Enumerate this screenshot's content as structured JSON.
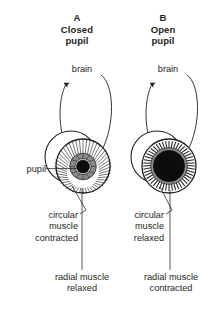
{
  "figure": {
    "type": "biological-diagram",
    "background_color": "#ffffff",
    "ink_color": "#231f20"
  },
  "panels": [
    {
      "id": "a",
      "letter": "A",
      "title": "A\nClosed\npupil",
      "state": "closed pupil",
      "brain_label": "brain",
      "pupil_label": "pupil",
      "circular_muscle_label": "circular\nmuscle\ncontracted",
      "radial_muscle_label": "radial muscle\nrelaxed",
      "pupil_diameter_px": 13,
      "iris_outer_diameter_px": 54,
      "iris_inner_diameter_px": 22,
      "eyeball_diameter_px": 52,
      "radial_line_count": 46
    },
    {
      "id": "b",
      "letter": "B",
      "title": "B\nOpen\npupil",
      "state": "open pupil",
      "brain_label": "brain",
      "circular_muscle_label": "circular\nmuscle\nrelaxed",
      "radial_muscle_label": "radial muscle\ncontracted",
      "pupil_diameter_px": 31,
      "iris_outer_diameter_px": 54,
      "iris_inner_diameter_px": 36,
      "eyeball_diameter_px": 52,
      "radial_line_count": 46
    }
  ]
}
